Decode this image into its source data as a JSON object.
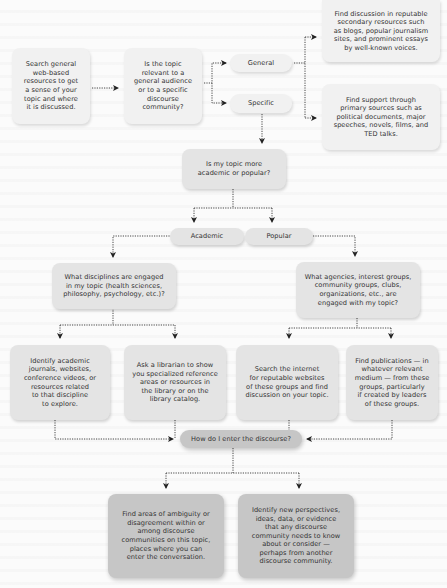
{
  "flowchart": {
    "colors": {
      "background": "#fbfbfb",
      "light_box": "#f1f1f1",
      "mid_box": "#e4e4e4",
      "dark_box": "#c6c6c6",
      "connector": "#333333"
    },
    "nodes": {
      "search_general": "Search general\nweb-based\nresources to get\na sense of your\ntopic and where\nit is discussed.",
      "audience_question": "Is the topic\nrelevant to a\ngeneral audience\nor to a specific\ndiscourse\ncommunity?",
      "general": "General",
      "specific": "Specific",
      "general_result": "Find discussion in reputable\nsecondary resources such\nas blogs, popular journalism\nsites, and prominent essays\nby well-known voices.",
      "specific_result": "Find support through\nprimary sources such as\npolitical documents, major\nspeeches, novels, films, and\nTED talks.",
      "academic_or_popular": "Is my topic more\nacademic or popular?",
      "academic": "Academic",
      "popular": "Popular",
      "disciplines_question": "What disciplines are engaged\nin my topic (health sciences,\nphilosophy, psychology, etc.)?",
      "agencies_question": "What agencies, interest groups,\ncommunity groups, clubs,\norganizations, etc., are\nengaged with my topic?",
      "identify_academic": "Identify academic\njournals, websites,\nconference videos, or\nresources related\nto that discipline\nto explore.",
      "ask_librarian": "Ask a librarian to show\nyou specialized reference\nareas or resources in\nthe library or on the\nlibrary catalog.",
      "search_internet": "Search the internet\nfor reputable websites\nof these groups and find\ndiscussion on your topic.",
      "find_publications": "Find publications — in\nwhatever relevant\nmedium — from these\ngroups, particularly\nif created by leaders\nof these groups.",
      "enter_discourse": "How do I enter the discourse?",
      "find_ambiguity": "Find areas of ambiguity or\ndisagreement within or\namong discourse\ncommunities on this topic,\nplaces where you can\nenter the conversation.",
      "identify_perspectives": "Identify new perspectives,\nideas, data, or evidence\nthat any discourse\ncommunity needs to know\nabout or consider —\nperhaps from another\ndiscourse community."
    }
  }
}
